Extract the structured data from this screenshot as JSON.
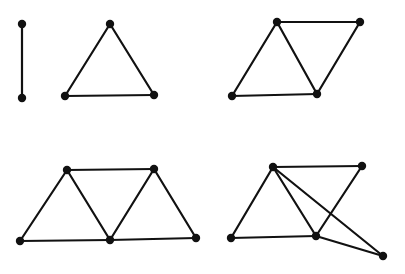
{
  "diagram": {
    "title": "",
    "width": 405,
    "height": 274,
    "colors": {
      "edge": "#111111",
      "vertex": "#111111",
      "background": "#ffffff"
    },
    "vertex_radius": 4.2,
    "graphs": [
      {
        "id": "graph-1-edge",
        "vertices": [
          [
            22,
            24
          ],
          [
            22,
            98
          ]
        ],
        "edges": [
          [
            0,
            1
          ]
        ]
      },
      {
        "id": "graph-2-triangle",
        "vertices": [
          [
            110,
            24
          ],
          [
            65,
            96
          ],
          [
            154,
            95
          ]
        ],
        "edges": [
          [
            0,
            1
          ],
          [
            1,
            2
          ],
          [
            2,
            0
          ]
        ]
      },
      {
        "id": "graph-3-two-triangles",
        "vertices": [
          [
            277,
            22
          ],
          [
            360,
            22
          ],
          [
            232,
            96
          ],
          [
            317,
            94
          ]
        ],
        "edges": [
          [
            0,
            1
          ],
          [
            0,
            2
          ],
          [
            2,
            3
          ],
          [
            0,
            3
          ],
          [
            3,
            1
          ]
        ]
      },
      {
        "id": "graph-4-three-triangles",
        "vertices": [
          [
            67,
            170
          ],
          [
            154,
            169
          ],
          [
            20,
            241
          ],
          [
            110,
            240
          ],
          [
            196,
            238
          ]
        ],
        "edges": [
          [
            0,
            1
          ],
          [
            0,
            2
          ],
          [
            2,
            3
          ],
          [
            0,
            3
          ],
          [
            3,
            1
          ],
          [
            1,
            4
          ],
          [
            3,
            4
          ]
        ]
      },
      {
        "id": "graph-5-crossing",
        "vertices": [
          [
            273,
            167
          ],
          [
            362,
            166
          ],
          [
            231,
            238
          ],
          [
            316,
            236
          ],
          [
            383,
            256
          ]
        ],
        "edges": [
          [
            0,
            1
          ],
          [
            0,
            2
          ],
          [
            2,
            3
          ],
          [
            0,
            3
          ],
          [
            3,
            1
          ],
          [
            0,
            4
          ],
          [
            3,
            4
          ]
        ]
      }
    ]
  }
}
